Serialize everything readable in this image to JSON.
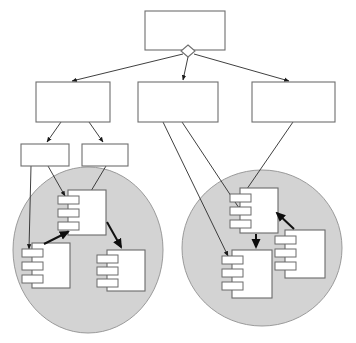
{
  "figure": {
    "kind": "uml-component-deployment-diagram",
    "caption": "",
    "canvas": {
      "width": 356,
      "height": 343,
      "background": "#ffffff"
    },
    "palette": {
      "box_fill": "#ffffff",
      "box_stroke": "#6e6e6e",
      "group_fill": "#d3d3d3",
      "group_stroke": "#9a9a9a",
      "association_stroke": "#2a2a2a",
      "dependency_stroke": "#111111"
    }
  },
  "nodes": {
    "root": {
      "id": "root-box",
      "label": "",
      "x": 145,
      "y": 11,
      "w": 80,
      "h": 39
    },
    "tier2": [
      {
        "id": "tier2-left-box",
        "label": "",
        "x": 36,
        "y": 82,
        "w": 74,
        "h": 40
      },
      {
        "id": "tier2-middle-box",
        "label": "",
        "x": 138,
        "y": 82,
        "w": 80,
        "h": 40
      },
      {
        "id": "tier2-right-box",
        "label": "",
        "x": 252,
        "y": 82,
        "w": 83,
        "h": 40
      }
    ],
    "tier3": [
      {
        "id": "tier3-left-box",
        "label": "",
        "x": 21,
        "y": 144,
        "w": 48,
        "h": 22
      },
      {
        "id": "tier3-right-box",
        "label": "",
        "x": 82,
        "y": 144,
        "w": 46,
        "h": 22
      }
    ]
  },
  "groups": [
    {
      "id": "group-left",
      "label": "",
      "cx": 88,
      "cy": 250,
      "rx": 75,
      "ry": 83
    },
    {
      "id": "group-right",
      "label": "",
      "cx": 262,
      "cy": 248,
      "rx": 80,
      "ry": 78
    }
  ],
  "components": [
    {
      "id": "comp-left-top",
      "label": "",
      "group": "group-left",
      "x": 68,
      "y": 190,
      "w": 38,
      "h": 45,
      "tabs": 3
    },
    {
      "id": "comp-left-bottom",
      "label": "",
      "group": "group-left",
      "x": 32,
      "y": 243,
      "w": 38,
      "h": 45,
      "tabs": 3
    },
    {
      "id": "comp-left-right",
      "label": "",
      "group": "group-left",
      "x": 107,
      "y": 250,
      "w": 38,
      "h": 41,
      "tabs": 3
    },
    {
      "id": "comp-right-top",
      "label": "",
      "group": "group-right",
      "x": 240,
      "y": 188,
      "w": 38,
      "h": 45,
      "tabs": 3
    },
    {
      "id": "comp-right-bottom",
      "label": "",
      "group": "group-right",
      "x": 232,
      "y": 250,
      "w": 40,
      "h": 48,
      "tabs": 3
    },
    {
      "id": "comp-right-side",
      "label": "",
      "group": "group-right",
      "x": 285,
      "y": 230,
      "w": 40,
      "h": 48,
      "tabs": 3
    }
  ],
  "edges": {
    "aggregation_diamond": {
      "id": "root-diamond",
      "cx": 188,
      "cy": 51,
      "size": 6
    },
    "associations": [
      {
        "id": "edge-root-to-tier2-left",
        "from": "root-diamond",
        "to": "tier2-left-box",
        "points": "183,54 70,82"
      },
      {
        "id": "edge-root-to-tier2-middle",
        "from": "root-diamond",
        "to": "tier2-middle-box",
        "points": "188,57 183,82"
      },
      {
        "id": "edge-root-to-tier2-right",
        "from": "root-diamond",
        "to": "tier2-right-box",
        "points": "194,54 290,82"
      },
      {
        "id": "edge-tier2left-to-tier3left",
        "from": "tier2-left-box",
        "to": "tier3-left-box",
        "points": "60,122 46,144"
      },
      {
        "id": "edge-tier2left-to-tier3right",
        "from": "tier2-left-box",
        "to": "tier3-right-box",
        "points": "90,122 104,144"
      },
      {
        "id": "edge-tier3left-to-compleftbottom",
        "from": "tier3-left-box",
        "to": "comp-left-bottom",
        "points": "31,166 29,250"
      },
      {
        "id": "edge-tier3left-to-complefttop",
        "from": "tier3-left-box",
        "to": "comp-left-top",
        "points": "48,166 66,197"
      },
      {
        "id": "edge-tier3right-to-complefttop",
        "from": "tier3-right-box",
        "to": "comp-left-top",
        "points": "104,166 72,222"
      },
      {
        "id": "edge-tier2middle-to-comprightbottom",
        "from": "tier2-middle-box",
        "to": "comp-right-bottom",
        "points": "163,122 229,257"
      },
      {
        "id": "edge-tier2middle-to-comprighttop",
        "from": "tier2-middle-box",
        "to": "comp-right-top",
        "points": "183,122 242,212"
      },
      {
        "id": "edge-tier2right-to-comprighttop",
        "from": "tier2-right-box",
        "to": "comp-right-top",
        "points": "292,122 240,200"
      }
    ],
    "dependencies": [
      {
        "id": "dep-leftbottom-to-lefttop",
        "from": "comp-left-bottom",
        "to": "comp-left-top",
        "points": "44,243 67,232"
      },
      {
        "id": "dep-lefttop-to-leftright",
        "from": "comp-left-top",
        "to": "comp-left-right",
        "points": "106,222 121,248"
      },
      {
        "id": "dep-righttop-to-rightbottom",
        "from": "comp-right-top",
        "to": "comp-right-bottom",
        "points": "256,233 256,248"
      },
      {
        "id": "dep-rightside-to-righttop",
        "from": "comp-right-side",
        "to": "comp-right-top",
        "points": "293,228 276,213"
      }
    ]
  }
}
